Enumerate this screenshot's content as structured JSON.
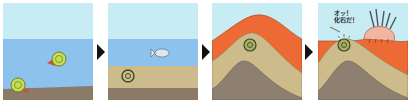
{
  "diagram": {
    "panels": [
      {
        "id": 1,
        "scene": "ammonites-living-in-sea",
        "description": "Ammonites swimming in the sea and resting on seabed"
      },
      {
        "id": 2,
        "scene": "ammonite-buried-in-sediment",
        "description": "Dead ammonite buried under sediment layers, fish swimming above"
      },
      {
        "id": 3,
        "scene": "strata-uplifted",
        "description": "Sediment layers folded and uplifted into a mountain with fossil inside"
      },
      {
        "id": 4,
        "scene": "fossil-discovered",
        "description": "Erosion exposes the fossil; a hedgehog-like creature discovers it"
      }
    ],
    "speech_bubble": "オッ！\n化石だ！",
    "speech_line1": "オッ！",
    "speech_line2": "化石だ！"
  },
  "colors": {
    "sky": "#c8ecf4",
    "sea": "#8cc2ec",
    "seabed": "#8a7a66",
    "sand_layer": "#cdbb8c",
    "orange_layer": "#ee6a34",
    "rock_layer": "#8e8070",
    "ammonite": "#c8de52",
    "arrow": "#111111"
  }
}
